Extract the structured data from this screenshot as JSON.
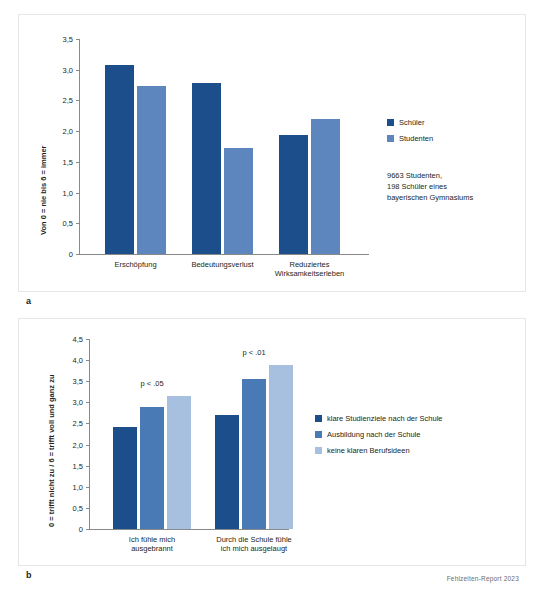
{
  "footer": {
    "text": "Fehlzeiten-Report 2023"
  },
  "panel_a": {
    "letter": "a",
    "legend": [
      {
        "label": "Schüler",
        "color": "#1c4e8c"
      },
      {
        "label": "Studenten",
        "color": "#5d86bf"
      }
    ],
    "note": "9663 Studenten,\n198 Schüler eines\nbayerischen Gymnasiums"
  },
  "panel_b": {
    "letter": "b",
    "legend": [
      {
        "label": "klare Studienziele nach der Schule",
        "color": "#1c4e8c"
      },
      {
        "label": "Ausbildung nach der Schule",
        "color": "#4a7ab5"
      },
      {
        "label": "keine klaren Berufsideen",
        "color": "#a8c0e0"
      }
    ]
  },
  "chart_data": [
    {
      "type": "bar",
      "id": "a",
      "title": "",
      "xlabel": "",
      "ylabel": "Von 0 = nie bis 6 = immer",
      "ylim": [
        0,
        3.5
      ],
      "yticks": [
        0,
        0.5,
        1.0,
        1.5,
        2.0,
        2.5,
        3.0,
        3.5
      ],
      "ytick_labels": [
        "0",
        "0,5",
        "1,0",
        "1,5",
        "2,0",
        "2,5",
        "3,0",
        "3,5"
      ],
      "categories": [
        "Erschöpfung",
        "Bedeutungsverlust",
        "Reduziertes\nWirksamkeitserleben"
      ],
      "grid": false,
      "legend_position": "right",
      "series": [
        {
          "name": "Schüler",
          "color": "#1c4e8c",
          "values": [
            3.07,
            2.78,
            1.93
          ]
        },
        {
          "name": "Studenten",
          "color": "#5d86bf",
          "values": [
            2.73,
            1.72,
            2.2
          ]
        }
      ],
      "annotations": []
    },
    {
      "type": "bar",
      "id": "b",
      "title": "",
      "xlabel": "",
      "ylabel": "0 = trifft nicht zu / 6 = trifft voll und ganz zu",
      "ylim": [
        0,
        4.5
      ],
      "yticks": [
        0,
        0.5,
        1.0,
        1.5,
        2.0,
        2.5,
        3.0,
        3.5,
        4.0,
        4.5
      ],
      "ytick_labels": [
        "0",
        "0,5",
        "1,0",
        "1,5",
        "2,0",
        "2,5",
        "3,0",
        "3,5",
        "4,0",
        "4,5"
      ],
      "categories": [
        "Ich fühle mich\nausgebrannt",
        "Durch die Schule fühle\nich mich ausgelaugt"
      ],
      "grid": false,
      "legend_position": "right",
      "series": [
        {
          "name": "klare Studienziele nach der Schule",
          "color": "#1c4e8c",
          "values": [
            2.42,
            2.69
          ]
        },
        {
          "name": "Ausbildung nach der Schule",
          "color": "#4a7ab5",
          "values": [
            2.9,
            3.55
          ]
        },
        {
          "name": "keine klaren Berufsideen",
          "color": "#a8c0e0",
          "values": [
            3.16,
            3.88
          ]
        }
      ],
      "annotations": [
        {
          "text": "p < .05",
          "group": 0
        },
        {
          "text": "p < .01",
          "group": 1
        }
      ]
    }
  ]
}
